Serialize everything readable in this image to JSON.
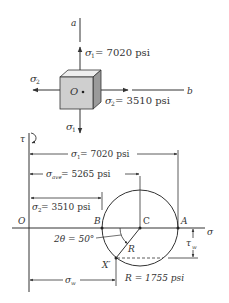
{
  "element_diagram": {
    "axis_a_label": "a",
    "axis_b_label": "b",
    "origin_label": "O",
    "sigma1_label": "σ",
    "sigma1_sub": "1",
    "sigma1_value": " = 7020 psi",
    "sigma2_label": "σ",
    "sigma2_sub": "2",
    "sigma2_value": " = 3510 psi",
    "sigma1_bottom_label": "σ",
    "sigma1_bottom_sub": "1",
    "sigma2_left_label": "σ",
    "sigma2_left_sub": "2"
  },
  "mohr_circle": {
    "tau_axis_label": "τ",
    "sigma_axis_label": "σ",
    "origin_label": "O",
    "point_B": "B",
    "point_C": "C",
    "point_A": "A",
    "point_Xprime": "X′",
    "radius_label": "R",
    "dim_sigma1": {
      "sym": "σ",
      "sub": "1",
      "text": " = 7020 psi"
    },
    "dim_sigma_ave": {
      "sym": "σ",
      "sub": "ave",
      "text": " = 5265 psi"
    },
    "dim_sigma2": {
      "sym": "σ",
      "sub": "2",
      "text": " = 3510 psi"
    },
    "dim_sigma_w": {
      "sym": "σ",
      "sub": "w"
    },
    "angle_label": "2θ = 50°",
    "tau_w": {
      "sym": "τ",
      "sub": "w"
    },
    "radius_value": "R = 1755 psi"
  },
  "colors": {
    "line": "#333333",
    "cube_front": "#cfcfcf",
    "cube_top": "#eeeeee",
    "cube_side": "#9a9a9a"
  }
}
